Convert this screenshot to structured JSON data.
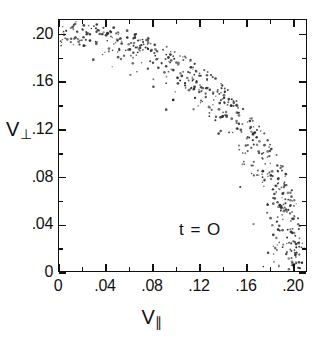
{
  "chart_data": {
    "type": "scatter",
    "title": "",
    "subtitle": "",
    "xlabel": "V∥",
    "ylabel": "V⊥",
    "xlabel_base": "V",
    "xlabel_sub": "∥",
    "ylabel_base": "V",
    "ylabel_sub": "⊥",
    "xlim": [
      0,
      0.212
    ],
    "ylim": [
      0,
      0.2122
    ],
    "xticks": [
      0,
      0.04,
      0.08,
      0.12,
      0.16,
      0.2
    ],
    "yticks": [
      0,
      0.04,
      0.08,
      0.12,
      0.16,
      0.2
    ],
    "xticklabels": [
      "0",
      ".04",
      ".08",
      ".12",
      ".16",
      ".20"
    ],
    "yticklabels": [
      "0",
      ".04",
      ".08",
      ".12",
      ".16",
      ".20"
    ],
    "minor_tick_interval": 0.02,
    "grid": false,
    "legend": null,
    "annotations": [
      {
        "text": "t = O",
        "x": 0.055,
        "y": 0.055
      }
    ],
    "marker": {
      "shape": "dot",
      "size_px": 1.3,
      "color": "#2b2b2b"
    },
    "distribution": {
      "form": "annulus-quadrant",
      "radius_mean": 0.2045,
      "radius_spread": 0.011,
      "n_points": 560,
      "theta_range_deg": [
        0,
        90
      ]
    }
  },
  "axes": {
    "frame_color": "#111111",
    "background": "#ffffff"
  }
}
